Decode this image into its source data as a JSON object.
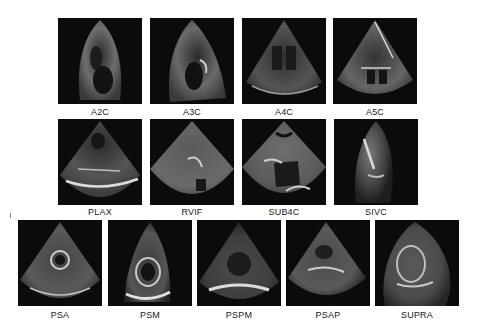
{
  "figure": {
    "rows": [
      {
        "tiles": [
          {
            "label": "A2C",
            "shape": "narrow"
          },
          {
            "label": "A3C",
            "shape": "narrow"
          },
          {
            "label": "A4C",
            "shape": "wide"
          },
          {
            "label": "A5C",
            "shape": "wide"
          }
        ]
      },
      {
        "tiles": [
          {
            "label": "PLAX",
            "shape": "wide"
          },
          {
            "label": "RVIF",
            "shape": "wide"
          },
          {
            "label": "SUB4C",
            "shape": "wide"
          },
          {
            "label": "SIVC",
            "shape": "narrow"
          }
        ]
      },
      {
        "tiles": [
          {
            "label": "PSA",
            "shape": "wide"
          },
          {
            "label": "PSM",
            "shape": "narrow"
          },
          {
            "label": "PSPM",
            "shape": "wide"
          },
          {
            "label": "PSAP",
            "shape": "wide"
          },
          {
            "label": "SUPRA",
            "shape": "wide"
          }
        ]
      }
    ]
  }
}
